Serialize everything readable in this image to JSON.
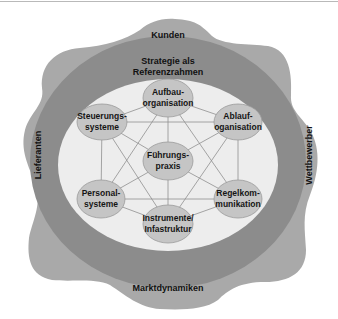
{
  "diagram": {
    "outer_region": {
      "top_label": "Kunden",
      "left_label": "Lieferanten",
      "right_label": "Wettbewerber",
      "bottom_label": "Marktdynamiken"
    },
    "strategy_ring": {
      "label_line1": "Strategie als",
      "label_line2": "Referenzrahmen"
    },
    "nodes": [
      {
        "id": "aufbau",
        "line1": "Aufbau-",
        "line2": "organisation"
      },
      {
        "id": "ablauf",
        "line1": "Ablauf-",
        "line2": "oganisation"
      },
      {
        "id": "regel",
        "line1": "Regelkom-",
        "line2": "munikation"
      },
      {
        "id": "instrumente",
        "line1": "Instrumente/",
        "line2": "Infastruktur"
      },
      {
        "id": "personal",
        "line1": "Personal-",
        "line2": "systeme"
      },
      {
        "id": "steuerung",
        "line1": "Steuerungs-",
        "line2": "systeme"
      },
      {
        "id": "fuehrung",
        "line1": "Führungs-",
        "line2": "praxis"
      }
    ],
    "colors": {
      "outer_blob": "#a9a9a9",
      "strategy_ring": "#8c8c8c",
      "inner_field": "#ededed",
      "node_fill": "#c5c5c5",
      "node_stroke": "#9a9a9a",
      "connector": "#8f8f8f"
    }
  }
}
